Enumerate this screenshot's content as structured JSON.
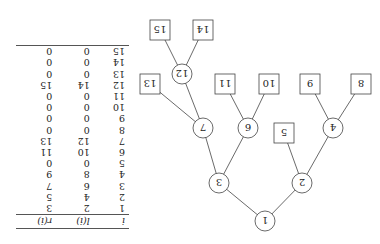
{
  "figure": {
    "orientation": "rotated 180 degrees",
    "tree": {
      "internal_nodes": [
        1,
        2,
        3,
        4,
        6,
        7,
        9,
        12
      ],
      "leaf_nodes": [
        5,
        8,
        10,
        11,
        13,
        14,
        15
      ],
      "edges": [
        [
          1,
          2
        ],
        [
          1,
          3
        ],
        [
          2,
          4
        ],
        [
          2,
          5
        ],
        [
          3,
          6
        ],
        [
          3,
          7
        ],
        [
          4,
          8
        ],
        [
          4,
          9
        ],
        [
          6,
          10
        ],
        [
          6,
          11
        ],
        [
          7,
          12
        ],
        [
          7,
          13
        ],
        [
          12,
          14
        ],
        [
          12,
          15
        ]
      ]
    },
    "table": {
      "headers": [
        "i",
        "l(i)",
        "r(i)"
      ],
      "rows": [
        [
          "1",
          "2",
          "3"
        ],
        [
          "2",
          "4",
          "5"
        ],
        [
          "3",
          "6",
          "7"
        ],
        [
          "4",
          "8",
          "9"
        ],
        [
          "5",
          "0",
          "0"
        ],
        [
          "6",
          "10",
          "11"
        ],
        [
          "7",
          "12",
          "13"
        ],
        [
          "8",
          "0",
          "0"
        ],
        [
          "9",
          "0",
          "0"
        ],
        [
          "10",
          "0",
          "0"
        ],
        [
          "11",
          "0",
          "0"
        ],
        [
          "12",
          "14",
          "15"
        ],
        [
          "13",
          "0",
          "0"
        ],
        [
          "14",
          "0",
          "0"
        ],
        [
          "15",
          "0",
          "0"
        ]
      ]
    }
  }
}
